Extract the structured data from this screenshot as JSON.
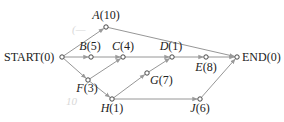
{
  "diagram": {
    "type": "activity-network",
    "nodes": [
      {
        "id": "START",
        "label": "START(0)",
        "name": "START",
        "value": "(0)",
        "x": 62,
        "y": 57
      },
      {
        "id": "A",
        "label": "A(10)",
        "name": "A",
        "value": "(10)",
        "x": 106,
        "y": 27
      },
      {
        "id": "B",
        "label": "B(5)",
        "name": "B",
        "value": "(5)",
        "x": 91,
        "y": 57
      },
      {
        "id": "C",
        "label": "C(4)",
        "name": "C",
        "value": "(4)",
        "x": 123,
        "y": 57
      },
      {
        "id": "D",
        "label": "D(1)",
        "name": "D",
        "value": "(1)",
        "x": 172,
        "y": 57
      },
      {
        "id": "E",
        "label": "E(8)",
        "name": "E",
        "value": "(8)",
        "x": 206,
        "y": 57
      },
      {
        "id": "END",
        "label": "END(0)",
        "name": "END",
        "value": "(0)",
        "x": 237,
        "y": 57
      },
      {
        "id": "F",
        "label": "F(3)",
        "name": "F",
        "value": "(3)",
        "x": 88,
        "y": 80
      },
      {
        "id": "G",
        "label": "G(7)",
        "name": "G",
        "value": "(7)",
        "x": 147,
        "y": 73
      },
      {
        "id": "H",
        "label": "H(1)",
        "name": "H",
        "value": "(1)",
        "x": 112,
        "y": 99
      },
      {
        "id": "J",
        "label": "J(6)",
        "name": "J",
        "value": "(6)",
        "x": 200,
        "y": 99
      }
    ],
    "edges": [
      [
        "START",
        "A"
      ],
      [
        "START",
        "B"
      ],
      [
        "START",
        "F"
      ],
      [
        "A",
        "END"
      ],
      [
        "B",
        "C"
      ],
      [
        "C",
        "D"
      ],
      [
        "F",
        "C"
      ],
      [
        "F",
        "H"
      ],
      [
        "H",
        "G"
      ],
      [
        "G",
        "D"
      ],
      [
        "H",
        "J"
      ],
      [
        "D",
        "E"
      ],
      [
        "E",
        "END"
      ],
      [
        "J",
        "END"
      ]
    ],
    "annotations": [
      {
        "text": "(—",
        "x": 72,
        "y": 33
      },
      {
        "text": "10",
        "x": 66,
        "y": 105
      }
    ]
  }
}
